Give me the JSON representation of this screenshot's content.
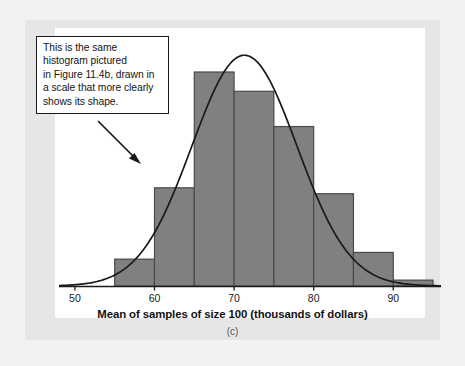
{
  "figure": {
    "panel_caption": "(c)",
    "callout_text": "This is the same\nhistogram pictured\nin Figure 11.4b, drawn in\na scale that more clearly\nshows its shape.",
    "colors": {
      "bar_fill": "#808080",
      "bar_stroke": "#4a4a4a",
      "curve": "#1a1a1a",
      "axis": "#1a1a1a",
      "callout_border": "#1a1a1a",
      "panel_background": "#e6e6e6",
      "plot_background": "#ffffff",
      "page_background": "#f2f2f2"
    }
  },
  "chart_data": {
    "type": "bar",
    "title": "",
    "subtitle": "",
    "xlabel": "Mean of samples of size 100 (thousands of dollars)",
    "ylabel": "",
    "xlim": [
      48,
      96
    ],
    "ylim": [
      0,
      30
    ],
    "grid": false,
    "legend": null,
    "xticks": [
      50,
      60,
      70,
      80,
      90
    ],
    "xtick_labels": [
      "50",
      "60",
      "70",
      "80",
      "90"
    ],
    "bin_width": 5,
    "bin_edges": [
      50,
      55,
      60,
      65,
      70,
      75,
      80,
      85,
      90,
      95
    ],
    "categories": [
      "50-55",
      "55-60",
      "60-65",
      "65-70",
      "70-75",
      "75-80",
      "80-85",
      "85-90",
      "90-95"
    ],
    "values": [
      0,
      3.2,
      11.7,
      25.5,
      23.2,
      19.0,
      11.0,
      4.0,
      0.7
    ],
    "overlay": {
      "type": "line",
      "name": "normal curve",
      "mean": 71.3,
      "sd": 6.6,
      "peak_value": 27.5
    },
    "annotations": [
      {
        "text": "This is the same histogram pictured in Figure 11.4b, drawn in a scale that more clearly shows its shape.",
        "points_to_bin": "60-65"
      }
    ]
  }
}
